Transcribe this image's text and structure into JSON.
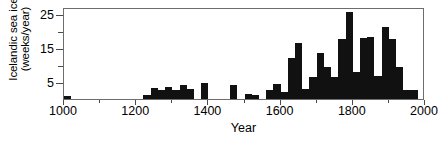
{
  "chart_data": {
    "type": "bar",
    "title": "",
    "subtitle": "",
    "xlabel": "Year",
    "ylabel": "Icelandic sea ice (weeks/year)",
    "ylabel_lines": [
      "Icelandic sea ice",
      "(weeks/year)"
    ],
    "xlim": [
      1000,
      2000
    ],
    "ylim": [
      0,
      27
    ],
    "grid": false,
    "legend": null,
    "bar_color": "#111111",
    "frame_color": "#6d6d6d",
    "xticks_major": [
      1000,
      1200,
      1400,
      1600,
      1800,
      2000
    ],
    "xtick_labels": [
      "1000",
      "1200",
      "1400",
      "1600",
      "1800",
      "2000"
    ],
    "xticks_minor": [
      1100,
      1300,
      1500,
      1700,
      1900
    ],
    "yticks_major": [
      5,
      15,
      25
    ],
    "ytick_labels": [
      "5",
      "15",
      "25"
    ],
    "yticks_minor": [
      10,
      20
    ],
    "bin_width": 20,
    "x": [
      1000,
      1020,
      1040,
      1060,
      1080,
      1100,
      1120,
      1140,
      1160,
      1180,
      1200,
      1220,
      1240,
      1260,
      1280,
      1300,
      1320,
      1340,
      1360,
      1380,
      1400,
      1420,
      1440,
      1460,
      1480,
      1500,
      1520,
      1540,
      1560,
      1580,
      1600,
      1620,
      1640,
      1660,
      1680,
      1700,
      1720,
      1740,
      1760,
      1780,
      1800,
      1820,
      1840,
      1860,
      1880,
      1900,
      1920,
      1940,
      1960,
      1980
    ],
    "values": [
      1.0,
      0,
      0,
      0,
      0,
      0,
      0,
      0,
      0,
      0,
      0,
      1.2,
      3.2,
      2.5,
      3.6,
      2.6,
      4.0,
      3.0,
      0,
      4.6,
      0,
      0,
      0,
      4.2,
      0,
      1.6,
      1.3,
      0,
      2.5,
      4.4,
      2.0,
      12.1,
      16.3,
      3.0,
      6.6,
      13.4,
      9.5,
      6.4,
      17.7,
      25.6,
      8.0,
      17.9,
      18.3,
      6.9,
      21.1,
      17.7,
      9.5,
      2.6,
      2.5,
      0
    ],
    "series": [
      {
        "name": "Icelandic sea ice",
        "values": [
          1.0,
          0,
          0,
          0,
          0,
          0,
          0,
          0,
          0,
          0,
          0,
          1.2,
          3.2,
          2.5,
          3.6,
          2.6,
          4.0,
          3.0,
          0,
          4.6,
          0,
          0,
          0,
          4.2,
          0,
          1.6,
          1.3,
          0,
          2.5,
          4.4,
          2.0,
          12.1,
          16.3,
          3.0,
          6.6,
          13.4,
          9.5,
          6.4,
          17.7,
          25.6,
          8.0,
          17.9,
          18.3,
          6.9,
          21.1,
          17.7,
          9.5,
          2.6,
          2.5,
          0
        ]
      }
    ]
  }
}
